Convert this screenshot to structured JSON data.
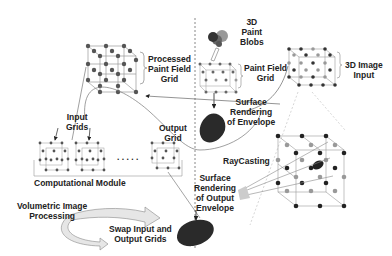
{
  "labels": {
    "processed_paint_field_grid": [
      "Processed",
      "Paint Field",
      "Grid"
    ],
    "paint_blobs": [
      "3D",
      "Paint",
      "Blobs"
    ],
    "paint_field_grid": [
      "Paint Field",
      "Grid"
    ],
    "image_input": [
      "3D Image",
      "Input"
    ],
    "surface_rendering_envelope": [
      "Surface",
      "Rendering",
      "of Envelope"
    ],
    "input_grids": [
      "Input",
      "Grids"
    ],
    "output_grid": [
      "Output",
      "Grid"
    ],
    "computational_module": "Computational Module",
    "raycasting": "RayCasting",
    "surface_rendering_output": [
      "Surface",
      "Rendering",
      "of Output",
      "Envelope"
    ],
    "volumetric_processing": [
      "Volumetric Image",
      "Processing"
    ],
    "swap_grids": [
      "Swap Input and",
      "Output Grids"
    ],
    "ellipsis": ". . . . ."
  },
  "colors": {
    "node_dark": "#444444",
    "node_light": "#999999",
    "blob": "#2a2a2a",
    "line": "#777777"
  }
}
